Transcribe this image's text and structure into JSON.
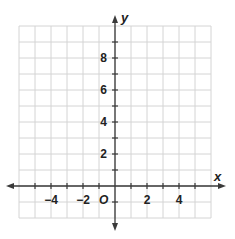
{
  "chart_data": {
    "type": "coordinate-grid",
    "title": "",
    "xlabel": "x",
    "ylabel": "y",
    "origin_label": "O",
    "xlim": [
      -6,
      6
    ],
    "ylim": [
      -2,
      10
    ],
    "grid": true,
    "grid_step": 1,
    "x_tick_labels": [
      {
        "value": -4,
        "label": "−4"
      },
      {
        "value": -2,
        "label": "−2"
      },
      {
        "value": 2,
        "label": "2"
      },
      {
        "value": 4,
        "label": "4"
      }
    ],
    "y_tick_labels": [
      {
        "value": 2,
        "label": "2"
      },
      {
        "value": 4,
        "label": "4"
      },
      {
        "value": 6,
        "label": "6"
      },
      {
        "value": 8,
        "label": "8"
      }
    ],
    "series": []
  },
  "axes": {
    "x_label": "x",
    "y_label": "y",
    "origin": "O"
  },
  "colors": {
    "grid": "#d4d4d4",
    "axis": "#3a3a3a",
    "text": "#222222"
  }
}
